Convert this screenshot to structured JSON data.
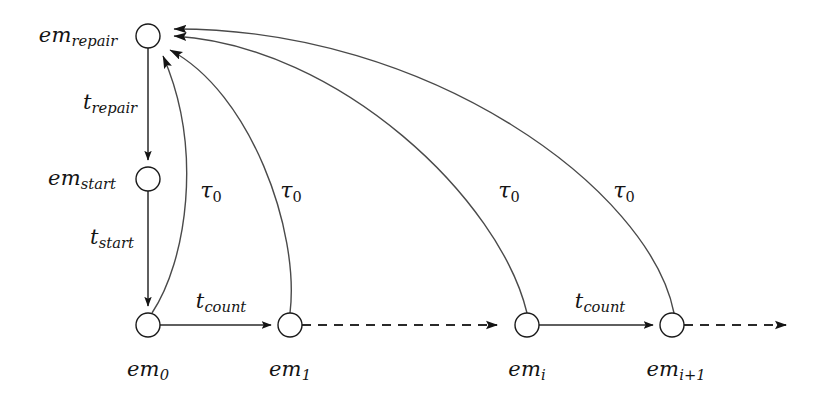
{
  "diagram": {
    "type": "state-transition-diagram",
    "title": "",
    "background_color": "#ffffff",
    "stroke_color": "#1a1a1a",
    "nodes": [
      {
        "id": "em_repair",
        "base": "em",
        "sub": "repair",
        "x": 148,
        "y": 36,
        "r": 12
      },
      {
        "id": "em_start",
        "base": "em",
        "sub": "start",
        "x": 148,
        "y": 179,
        "r": 12
      },
      {
        "id": "em_0",
        "base": "em",
        "sub": "0",
        "x": 148,
        "y": 325,
        "r": 12
      },
      {
        "id": "em_1",
        "base": "em",
        "sub": "1",
        "x": 290,
        "y": 325,
        "r": 12
      },
      {
        "id": "em_i",
        "base": "em",
        "sub": "i",
        "x": 527,
        "y": 325,
        "r": 12
      },
      {
        "id": "em_i1",
        "base": "em",
        "sub": "i+1",
        "x": 672,
        "y": 325,
        "r": 12
      }
    ],
    "node_labels": [
      {
        "for": "em_repair",
        "base": "em",
        "sub": "repair",
        "x": 78,
        "y": 37
      },
      {
        "for": "em_start",
        "base": "em",
        "sub": "start",
        "x": 82,
        "y": 180
      },
      {
        "for": "em_0",
        "base": "em",
        "sub": "0",
        "x": 148,
        "y": 371
      },
      {
        "for": "em_1",
        "base": "em",
        "sub": "1",
        "x": 290,
        "y": 371
      },
      {
        "for": "em_i",
        "base": "em",
        "sub": "i",
        "x": 527,
        "y": 371
      },
      {
        "for": "em_i1",
        "base": "em",
        "sub": "i+1",
        "x": 676,
        "y": 371
      }
    ],
    "transition_labels": [
      {
        "id": "t_repair",
        "base": "t",
        "sub": "repair",
        "x": 110,
        "y": 104,
        "kind": "transition"
      },
      {
        "id": "t_start",
        "base": "t",
        "sub": "start",
        "x": 112,
        "y": 239,
        "kind": "transition"
      },
      {
        "id": "t_count_0",
        "base": "t",
        "sub": "count",
        "x": 221,
        "y": 303,
        "kind": "transition"
      },
      {
        "id": "t_count_i",
        "base": "t",
        "sub": "count",
        "x": 600,
        "y": 303,
        "kind": "transition"
      },
      {
        "id": "tau_0_a",
        "base": "τ",
        "sub": "0",
        "x": 211,
        "y": 192,
        "kind": "tau"
      },
      {
        "id": "tau_0_b",
        "base": "τ",
        "sub": "0",
        "x": 291,
        "y": 192,
        "kind": "tau"
      },
      {
        "id": "tau_0_c",
        "base": "τ",
        "sub": "0",
        "x": 509,
        "y": 192,
        "kind": "tau"
      },
      {
        "id": "tau_0_d",
        "base": "τ",
        "sub": "0",
        "x": 624,
        "y": 192,
        "kind": "tau"
      }
    ],
    "edges": [
      {
        "id": "edge-repair-to-start",
        "from": "em_repair",
        "to": "em_start",
        "style": "solid",
        "label": "t_repair",
        "arrow": true
      },
      {
        "id": "edge-start-to-em0",
        "from": "em_start",
        "to": "em_0",
        "style": "solid",
        "label": "t_start",
        "arrow": true
      },
      {
        "id": "edge-em0-to-em1",
        "from": "em_0",
        "to": "em_1",
        "style": "solid",
        "label": "t_count",
        "arrow": true
      },
      {
        "id": "edge-emi-to-emi1",
        "from": "em_i",
        "to": "em_i1",
        "style": "solid",
        "label": "t_count",
        "arrow": true
      },
      {
        "id": "edge-em1-to-emi",
        "from": "em_1",
        "to": "em_i",
        "style": "dashed",
        "label": "",
        "arrow": true
      },
      {
        "id": "edge-emi1-to-next",
        "from": "em_i1",
        "to": "continuation",
        "style": "dashed",
        "label": "",
        "arrow": true
      },
      {
        "id": "edge-em0-to-repair",
        "from": "em_0",
        "to": "em_repair",
        "style": "curve",
        "label": "tau_0_a",
        "arrow": true
      },
      {
        "id": "edge-em1-to-repair",
        "from": "em_1",
        "to": "em_repair",
        "style": "curve",
        "label": "tau_0_b",
        "arrow": true
      },
      {
        "id": "edge-emi-to-repair",
        "from": "em_i",
        "to": "em_repair",
        "style": "curve",
        "label": "tau_0_c",
        "arrow": true
      },
      {
        "id": "edge-emi1-to-repair",
        "from": "em_i1",
        "to": "em_repair",
        "style": "curve",
        "label": "tau_0_d",
        "arrow": true
      }
    ]
  }
}
